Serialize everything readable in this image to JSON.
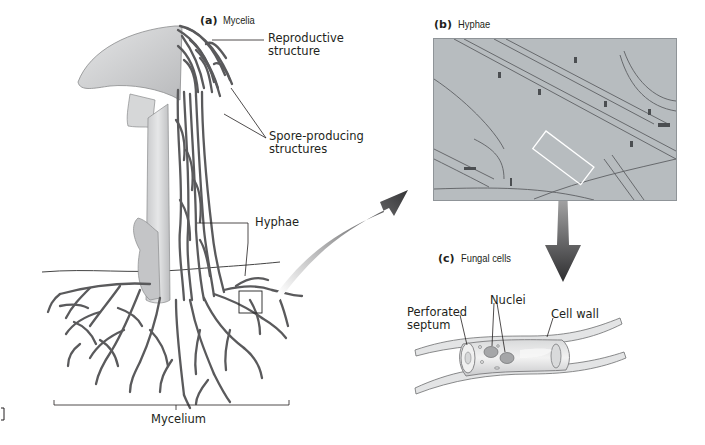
{
  "figure": {
    "panels": [
      {
        "id": "a",
        "letter": "(a)",
        "title": "Mycelia"
      },
      {
        "id": "b",
        "letter": "(b)",
        "title": "Hyphae"
      },
      {
        "id": "c",
        "letter": "(c)",
        "title": "Fungal cells"
      }
    ],
    "labels": {
      "reproductive_structure_line1": "Reproductive",
      "reproductive_structure_line2": "structure",
      "spore_producing_line1": "Spore-producing",
      "spore_producing_line2": "structures",
      "hyphae": "Hyphae",
      "mycelium": "Mycelium",
      "perforated_septum_line1": "Perforated",
      "perforated_septum_line2": "septum",
      "nuclei": "Nuclei",
      "cell_wall": "Cell wall"
    },
    "colors": {
      "hyphae": "#5a5a5c",
      "mushroom": "#cfd0d2",
      "micrograph_bg": "#b7bcbf",
      "arrow_dark": "#3a3a3c"
    }
  }
}
